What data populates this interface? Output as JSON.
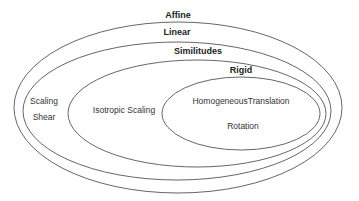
{
  "diagram": {
    "type": "nested-set (euler) diagram",
    "sets": [
      {
        "id": "affine",
        "label": "Affine",
        "members": [],
        "ellipse": {
          "cx": 178,
          "cy": 107.5,
          "rx": 164,
          "ry": 85.5
        },
        "label_pos": {
          "x": 178,
          "y": 18
        }
      },
      {
        "id": "linear",
        "label": "Linear",
        "members": [
          "Scaling",
          "Shear"
        ],
        "ellipse": {
          "cx": 177,
          "cy": 111,
          "rx": 154,
          "ry": 69
        },
        "label_pos": {
          "x": 177,
          "y": 35
        }
      },
      {
        "id": "similitudes",
        "label": "Similitudes",
        "members": [
          "Isotropic Scaling"
        ],
        "ellipse": {
          "cx": 197,
          "cy": 113.5,
          "rx": 129,
          "ry": 53.5
        },
        "label_pos": {
          "x": 198,
          "y": 54
        }
      },
      {
        "id": "rigid",
        "label": "Rigid",
        "members": [
          "HomogeneousTranslation",
          "Rotation"
        ],
        "ellipse": {
          "cx": 241,
          "cy": 113.5,
          "rx": 79,
          "ry": 36.5
        },
        "label_pos": {
          "x": 241,
          "y": 73
        }
      }
    ],
    "member_labels": {
      "scaling": {
        "text": "Scaling",
        "x": 44,
        "y": 104
      },
      "shear": {
        "text": "Shear",
        "x": 44,
        "y": 120
      },
      "isotropic_scaling": {
        "text": "Isotropic Scaling",
        "x": 124,
        "y": 113
      },
      "homogeneous_translation": {
        "text": "HomogeneousTranslation",
        "x": 241,
        "y": 104
      },
      "rotation": {
        "text": "Rotation",
        "x": 243,
        "y": 129
      }
    },
    "stroke_color": "#555555",
    "text_color": "#333333"
  }
}
